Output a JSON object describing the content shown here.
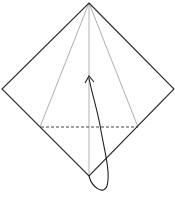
{
  "diagram": {
    "type": "origami-fold-step",
    "colors": {
      "outline": "#2a2a2a",
      "crease": "#9a9a9a",
      "dashed": "#444444",
      "arrow": "#222222",
      "background": "#ffffff"
    },
    "shapes": {
      "diamond": {
        "top": [
          89,
          3
        ],
        "right": [
          174,
          89
        ],
        "bottom": [
          89,
          176
        ],
        "left": [
          2,
          89
        ]
      },
      "crease_left": {
        "from": [
          89,
          3
        ],
        "to": [
          40,
          127
        ]
      },
      "crease_right": {
        "from": [
          89,
          3
        ],
        "to": [
          138,
          127
        ]
      },
      "center_crease": {
        "from": [
          89,
          3
        ],
        "to": [
          89,
          176
        ]
      },
      "valley_fold_line": {
        "from": [
          40,
          127
        ],
        "to": [
          138,
          127
        ]
      },
      "fold_arrow": {
        "start": [
          89,
          176
        ],
        "loop_bottom": [
          104,
          190
        ],
        "end": [
          89,
          77
        ]
      }
    }
  },
  "caption": {
    "text": ""
  }
}
